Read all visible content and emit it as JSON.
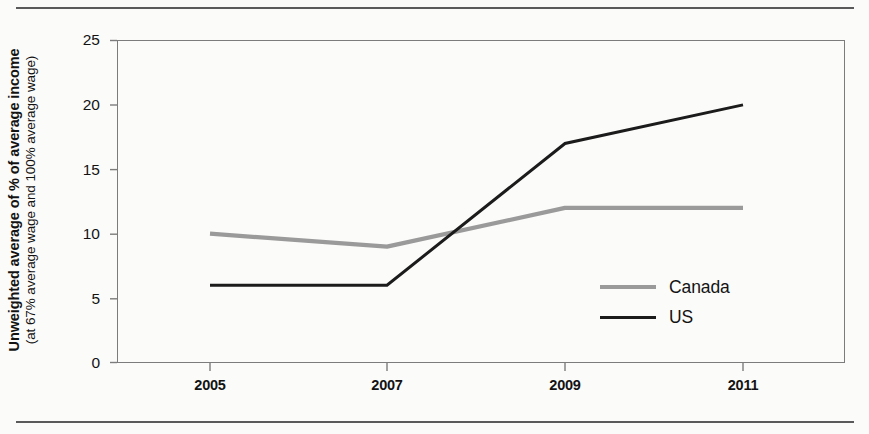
{
  "chart_data": {
    "type": "line",
    "title": "",
    "xlabel": "",
    "ylabel_bold": "Unweighted average of % of average income",
    "ylabel_sub": "(at 67% average wage and 100% average wage)",
    "categories": [
      "2005",
      "2007",
      "2009",
      "2011"
    ],
    "x": [
      2005,
      2007,
      2009,
      2011
    ],
    "series": [
      {
        "name": "Canada",
        "values": [
          10,
          9,
          12,
          12
        ],
        "color": "#9a9a9a"
      },
      {
        "name": "US",
        "values": [
          6,
          6,
          17,
          20
        ],
        "color": "#1b1b1b"
      }
    ],
    "yticks": [
      "0",
      "5",
      "10",
      "15",
      "20",
      "25"
    ],
    "ylim": [
      0,
      25
    ],
    "grid": false,
    "legend_position": "inside-right-center"
  },
  "axis": {
    "y_ticks": [
      {
        "label": "25",
        "value": 25
      },
      {
        "label": "20",
        "value": 20
      },
      {
        "label": "15",
        "value": 15
      },
      {
        "label": "10",
        "value": 10
      },
      {
        "label": "5",
        "value": 5
      },
      {
        "label": "0",
        "value": 0
      }
    ],
    "x_ticks": [
      {
        "label": "2005"
      },
      {
        "label": "2007"
      },
      {
        "label": "2009"
      },
      {
        "label": "2011"
      }
    ]
  },
  "legend": {
    "entries": [
      {
        "label": "Canada",
        "swatch": "canada-line-swatch"
      },
      {
        "label": "US",
        "swatch": "us-line-swatch"
      }
    ]
  }
}
